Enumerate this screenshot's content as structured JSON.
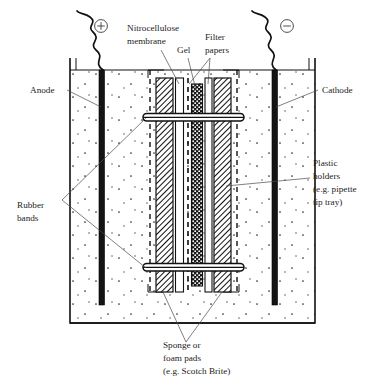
{
  "figure": {
    "background_color": "#ffffff",
    "ink_color": "#111111"
  },
  "terminals": {
    "positive": {
      "symbol": "+",
      "name": "positive-terminal",
      "side": "left"
    },
    "negative": {
      "symbol": "−",
      "name": "negative-terminal",
      "side": "right"
    }
  },
  "labels": {
    "anode": "Anode",
    "cathode": "Cathode",
    "nitrocellulose_membrane_line1": "Nitrocellulose",
    "nitrocellulose_membrane_line2": "membrane",
    "gel": "Gel",
    "filter_papers_line1": "Filter",
    "filter_papers_line2": "papers",
    "plastic_holders_line1": "Plastic",
    "plastic_holders_line2": "holders",
    "plastic_holders_line3": "(e.g. pipette",
    "plastic_holders_line4": "tip tray)",
    "rubber_bands_line1": "Rubber",
    "rubber_bands_line2": "bands",
    "sponge_pads_line1": "Sponge or",
    "sponge_pads_line2": "foam pads",
    "sponge_pads_line3": "(e.g. Scotch Brite)"
  },
  "stack": {
    "layers": [
      {
        "name": "sponge-pad-left",
        "pattern": "diagonal-hatch",
        "x": 156,
        "width": 17
      },
      {
        "name": "nitrocellulose-membrane",
        "pattern": "blank-outline",
        "x": 176,
        "width": 8
      },
      {
        "name": "filter-paper-left",
        "pattern": "dashed-line",
        "x": 186,
        "width": 4
      },
      {
        "name": "gel",
        "pattern": "dotted-fill",
        "x": 192,
        "width": 11
      },
      {
        "name": "filter-paper-right",
        "pattern": "blank-outline",
        "x": 205,
        "width": 7
      },
      {
        "name": "sponge-pad-right",
        "pattern": "diagonal-hatch",
        "x": 214,
        "width": 17
      }
    ]
  },
  "electrodes": [
    {
      "name": "anode-electrode",
      "x": 98,
      "polarity": "+"
    },
    {
      "name": "cathode-electrode",
      "x": 271,
      "polarity": "−"
    }
  ],
  "rubber_bands": [
    {
      "name": "rubber-band-upper",
      "y": 117
    },
    {
      "name": "rubber-band-lower",
      "y": 267
    }
  ],
  "tank": {
    "name": "buffer-tank",
    "fill_texture": "sparse-dots",
    "left": 70,
    "right": 315,
    "top": 70,
    "bottom": 323
  }
}
